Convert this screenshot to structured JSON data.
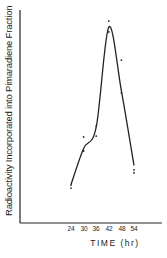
{
  "chart_data": {
    "type": "line",
    "title": "",
    "xlabel": "TIME (hr)",
    "ylabel": "Radioactivity Incorporated into Pimaradiene Fraction",
    "x_ticks": [
      24,
      30,
      36,
      42,
      48,
      54
    ],
    "xlim": [
      0,
      64
    ],
    "ylim": [
      0,
      100
    ],
    "y_units": "relative (no y tick labels shown)",
    "grid": false,
    "legend": null,
    "series": [
      {
        "name": "measured points (scatter)",
        "points": [
          {
            "x": 24,
            "y": 16.4
          },
          {
            "x": 24,
            "y": 17.8
          },
          {
            "x": 30,
            "y": 33.8
          },
          {
            "x": 30,
            "y": 40.4
          },
          {
            "x": 36,
            "y": 40.8
          },
          {
            "x": 36,
            "y": 45.5
          },
          {
            "x": 42,
            "y": 89.7
          },
          {
            "x": 42,
            "y": 94.8
          },
          {
            "x": 48,
            "y": 61.0
          },
          {
            "x": 48,
            "y": 76.5
          },
          {
            "x": 54,
            "y": 23.5
          },
          {
            "x": 54,
            "y": 24.9
          }
        ]
      },
      {
        "name": "fitted curve",
        "points": [
          {
            "x": 24,
            "y": 18
          },
          {
            "x": 30,
            "y": 35
          },
          {
            "x": 36,
            "y": 45
          },
          {
            "x": 42,
            "y": 92
          },
          {
            "x": 48,
            "y": 62
          },
          {
            "x": 54,
            "y": 27
          }
        ]
      }
    ]
  },
  "axes": {
    "xlabel": "TIME (hr)",
    "ylabel": "Radioactivity Incorporated into Pimaradiene Fraction",
    "ticks": [
      "24",
      "30",
      "36",
      "42",
      "48",
      "54"
    ]
  }
}
